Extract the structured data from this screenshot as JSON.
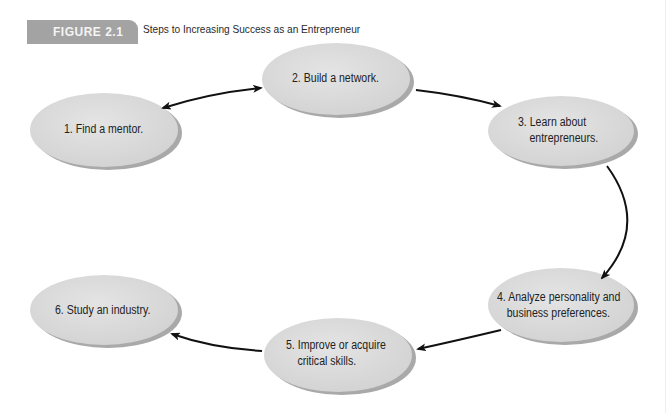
{
  "figure": {
    "label": "FIGURE 2.1",
    "title": "Steps to Increasing Success as an Entrepreneur",
    "label_color": "#a3a3a3"
  },
  "nodes": [
    {
      "id": 1,
      "lines": [
        "1. Find a mentor."
      ]
    },
    {
      "id": 2,
      "lines": [
        "2. Build a network."
      ]
    },
    {
      "id": 3,
      "lines": [
        "3. Learn about",
        "entrepreneurs."
      ]
    },
    {
      "id": 4,
      "lines": [
        "4. Analyze personality and",
        "business preferences."
      ]
    },
    {
      "id": 5,
      "lines": [
        "5. Improve or acquire",
        "critical skills."
      ]
    },
    {
      "id": 6,
      "lines": [
        "6. Study an industry."
      ]
    }
  ],
  "edges": [
    {
      "from": 1,
      "to": 2,
      "type": "bidirectional"
    },
    {
      "from": 2,
      "to": 3,
      "type": "directed"
    },
    {
      "from": 3,
      "to": 4,
      "type": "directed"
    },
    {
      "from": 4,
      "to": 5,
      "type": "directed"
    },
    {
      "from": 5,
      "to": 6,
      "type": "directed"
    }
  ],
  "colors": {
    "node_fill": "#dcdcdc",
    "node_shadow": "#9a9a9a",
    "arrow": "#111111"
  }
}
